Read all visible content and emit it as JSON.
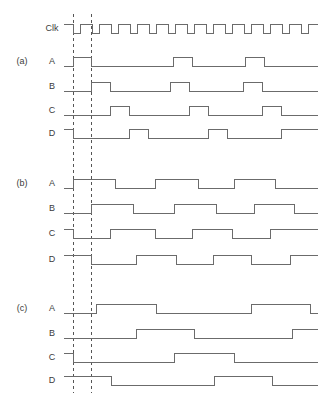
{
  "figure": {
    "title": "",
    "width": 332,
    "height": 393,
    "background": "#ffffff",
    "wave_color": "#6b6b6b",
    "marker_color": "#555555",
    "text_color": "#3b3b3b"
  },
  "geometry": {
    "x_start": 64,
    "x_end": 318,
    "high_offset": -9,
    "low_offset": 0,
    "clk_high_offset": -9
  },
  "markers": {
    "label": "reference-edges",
    "x_positions": [
      73,
      91
    ],
    "y_top": 14,
    "y_bottom": 393
  },
  "clock": {
    "label": "Clk",
    "label_x": 52,
    "y_baseline": 33,
    "period": 19,
    "first_edge": 73,
    "pulse_width": 7,
    "pulse_count": 13,
    "idle_level": "high",
    "description": "Clock idles high with 13 narrow low-going pulses"
  },
  "chart_data": {
    "type": "line",
    "xlabel": "time",
    "ylabel": "logic level",
    "signal_levels": [
      "0",
      "1"
    ],
    "groups": [
      {
        "name": "(a)",
        "group_label_x": 22,
        "signals": [
          {
            "name": "A",
            "label_x": 52,
            "y_baseline": 66,
            "start_level": 0,
            "transitions": [
              73,
              91,
              173,
              192,
              245,
              264
            ]
          },
          {
            "name": "B",
            "label_x": 52,
            "y_baseline": 91,
            "start_level": 0,
            "transitions": [
              91,
              110,
              170,
              189,
              243,
              262
            ]
          },
          {
            "name": "C",
            "label_x": 52,
            "y_baseline": 115,
            "start_level": 0,
            "transitions": [
              110,
              129,
              189,
              208,
              262,
              281
            ]
          },
          {
            "name": "D",
            "label_x": 52,
            "y_baseline": 138,
            "start_level": 1,
            "transitions": [
              73,
              129,
              148,
              208,
              227,
              281
            ]
          }
        ]
      },
      {
        "name": "(b)",
        "group_label_x": 22,
        "signals": [
          {
            "name": "A",
            "label_x": 52,
            "y_baseline": 188,
            "start_level": 0,
            "transitions": [
              73,
              115,
              155,
              198,
              234,
              275
            ]
          },
          {
            "name": "B",
            "label_x": 52,
            "y_baseline": 213,
            "start_level": 0,
            "transitions": [
              91,
              133,
              174,
              216,
              254,
              294
            ]
          },
          {
            "name": "C",
            "label_x": 52,
            "y_baseline": 238,
            "start_level": 1,
            "transitions": [
              73,
              110,
              155,
              192,
              232,
              270
            ]
          },
          {
            "name": "D",
            "label_x": 52,
            "y_baseline": 264,
            "start_level": 1,
            "transitions": [
              91,
              136,
              176,
              213,
              251,
              290
            ]
          }
        ]
      },
      {
        "name": "(c)",
        "group_label_x": 22,
        "signals": [
          {
            "name": "A",
            "label_x": 52,
            "y_baseline": 313,
            "start_level": 0,
            "transitions": [
              96,
              156,
              251,
              310
            ]
          },
          {
            "name": "B",
            "label_x": 52,
            "y_baseline": 338,
            "start_level": 0,
            "transitions": [
              136,
              194,
              292
            ]
          },
          {
            "name": "C",
            "label_x": 52,
            "y_baseline": 362,
            "start_level": 1,
            "transitions": [
              73,
              174,
              234
            ]
          },
          {
            "name": "D",
            "label_x": 52,
            "y_baseline": 385,
            "start_level": 1,
            "transitions": [
              111,
              214,
              272
            ]
          }
        ]
      }
    ]
  }
}
